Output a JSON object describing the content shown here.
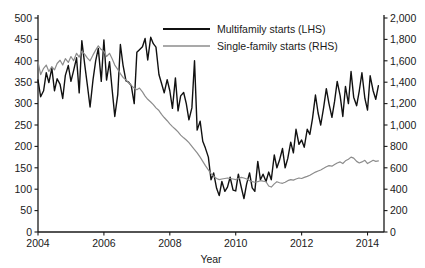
{
  "chart_data": {
    "type": "line",
    "title": "",
    "xlabel": "Year",
    "ylabel": "",
    "grid": false,
    "legend_position": "top-center",
    "xlim": [
      2004,
      2014.5
    ],
    "x_ticks": [
      2004,
      2006,
      2008,
      2010,
      2012,
      2014
    ],
    "x_tick_labels": [
      "2004",
      "2006",
      "2008",
      "2010",
      "2012",
      "2014"
    ],
    "left_axis": {
      "label": "",
      "ylim": [
        0,
        500
      ],
      "ticks": [
        0,
        50,
        100,
        150,
        200,
        250,
        300,
        350,
        400,
        450,
        500
      ],
      "tick_labels": [
        "0",
        "50",
        "100",
        "150",
        "200",
        "250",
        "300",
        "350",
        "400",
        "450",
        "500"
      ]
    },
    "right_axis": {
      "label": "",
      "ylim": [
        0,
        2000
      ],
      "ticks": [
        0,
        200,
        400,
        600,
        800,
        1000,
        1200,
        1400,
        1600,
        1800,
        2000
      ],
      "tick_labels": [
        "0",
        "200",
        "400",
        "600",
        "800",
        "1,000",
        "1,200",
        "1,400",
        "1,600",
        "1,800",
        "2,000"
      ]
    },
    "series": [
      {
        "name": "Multifamily starts (LHS)",
        "axis": "left",
        "color": "#111111",
        "width": 1.4,
        "x": [
          2004.0,
          2004.08,
          2004.17,
          2004.25,
          2004.33,
          2004.42,
          2004.5,
          2004.58,
          2004.67,
          2004.75,
          2004.83,
          2004.92,
          2005.0,
          2005.08,
          2005.17,
          2005.25,
          2005.33,
          2005.42,
          2005.5,
          2005.58,
          2005.67,
          2005.75,
          2005.83,
          2005.92,
          2006.0,
          2006.08,
          2006.17,
          2006.25,
          2006.33,
          2006.42,
          2006.5,
          2006.58,
          2006.67,
          2006.75,
          2006.83,
          2006.92,
          2007.0,
          2007.08,
          2007.17,
          2007.25,
          2007.33,
          2007.42,
          2007.5,
          2007.58,
          2007.67,
          2007.75,
          2007.83,
          2007.92,
          2008.0,
          2008.08,
          2008.17,
          2008.25,
          2008.33,
          2008.42,
          2008.5,
          2008.58,
          2008.67,
          2008.75,
          2008.83,
          2008.92,
          2009.0,
          2009.08,
          2009.17,
          2009.25,
          2009.33,
          2009.42,
          2009.5,
          2009.58,
          2009.67,
          2009.75,
          2009.83,
          2009.92,
          2010.0,
          2010.08,
          2010.17,
          2010.25,
          2010.33,
          2010.42,
          2010.5,
          2010.58,
          2010.67,
          2010.75,
          2010.83,
          2010.92,
          2011.0,
          2011.08,
          2011.17,
          2011.25,
          2011.33,
          2011.42,
          2011.5,
          2011.58,
          2011.67,
          2011.75,
          2011.83,
          2011.92,
          2012.0,
          2012.08,
          2012.17,
          2012.25,
          2012.33,
          2012.42,
          2012.5,
          2012.58,
          2012.67,
          2012.75,
          2012.83,
          2012.92,
          2013.0,
          2013.08,
          2013.17,
          2013.25,
          2013.33,
          2013.42,
          2013.5,
          2013.58,
          2013.67,
          2013.75,
          2013.83,
          2013.92,
          2014.0,
          2014.08,
          2014.17,
          2014.25,
          2014.33
        ],
        "values": [
          355,
          316,
          330,
          372,
          349,
          383,
          330,
          358,
          345,
          312,
          366,
          389,
          352,
          377,
          407,
          325,
          447,
          390,
          342,
          292,
          356,
          400,
          429,
          352,
          449,
          355,
          398,
          333,
          270,
          321,
          438,
          390,
          353,
          350,
          342,
          300,
          420,
          426,
          433,
          452,
          402,
          455,
          440,
          432,
          368,
          347,
          325,
          356,
          330,
          289,
          360,
          283,
          318,
          326,
          300,
          262,
          290,
          400,
          238,
          259,
          212,
          196,
          175,
          122,
          138,
          102,
          85,
          118,
          95,
          105,
          128,
          98,
          96,
          135,
          104,
          78,
          112,
          138,
          103,
          95,
          165,
          122,
          135,
          118,
          140,
          122,
          180,
          150,
          168,
          195,
          150,
          172,
          210,
          185,
          240,
          205,
          215,
          198,
          240,
          228,
          265,
          320,
          278,
          250,
          292,
          335,
          300,
          268,
          305,
          352,
          318,
          270,
          340,
          300,
          375,
          315,
          295,
          330,
          372,
          312,
          285,
          365,
          330,
          310,
          342
        ]
      },
      {
        "name": "Single-family starts (RHS)",
        "axis": "right",
        "color": "#8c8c8c",
        "width": 1.2,
        "x": [
          2004.0,
          2004.08,
          2004.17,
          2004.25,
          2004.33,
          2004.42,
          2004.5,
          2004.58,
          2004.67,
          2004.75,
          2004.83,
          2004.92,
          2005.0,
          2005.08,
          2005.17,
          2005.25,
          2005.33,
          2005.42,
          2005.5,
          2005.58,
          2005.67,
          2005.75,
          2005.83,
          2005.92,
          2006.0,
          2006.08,
          2006.17,
          2006.25,
          2006.33,
          2006.42,
          2006.5,
          2006.58,
          2006.67,
          2006.75,
          2006.83,
          2006.92,
          2007.0,
          2007.08,
          2007.17,
          2007.25,
          2007.33,
          2007.42,
          2007.5,
          2007.58,
          2007.67,
          2007.75,
          2007.83,
          2007.92,
          2008.0,
          2008.08,
          2008.17,
          2008.25,
          2008.33,
          2008.42,
          2008.5,
          2008.58,
          2008.67,
          2008.75,
          2008.83,
          2008.92,
          2009.0,
          2009.08,
          2009.17,
          2009.25,
          2009.33,
          2009.42,
          2009.5,
          2009.58,
          2009.67,
          2009.75,
          2009.83,
          2009.92,
          2010.0,
          2010.08,
          2010.17,
          2010.25,
          2010.33,
          2010.42,
          2010.5,
          2010.58,
          2010.67,
          2010.75,
          2010.83,
          2010.92,
          2011.0,
          2011.08,
          2011.17,
          2011.25,
          2011.33,
          2011.42,
          2011.5,
          2011.58,
          2011.67,
          2011.75,
          2011.83,
          2011.92,
          2012.0,
          2012.08,
          2012.17,
          2012.25,
          2012.33,
          2012.42,
          2012.5,
          2012.58,
          2012.67,
          2012.75,
          2012.83,
          2012.92,
          2013.0,
          2013.08,
          2013.17,
          2013.25,
          2013.33,
          2013.42,
          2013.5,
          2013.58,
          2013.67,
          2013.75,
          2013.83,
          2013.92,
          2014.0,
          2014.08,
          2014.17,
          2014.25,
          2014.33
        ],
        "values": [
          1590,
          1470,
          1530,
          1560,
          1500,
          1545,
          1515,
          1575,
          1605,
          1560,
          1620,
          1585,
          1640,
          1600,
          1670,
          1635,
          1690,
          1660,
          1625,
          1600,
          1655,
          1700,
          1740,
          1705,
          1690,
          1640,
          1670,
          1620,
          1560,
          1520,
          1480,
          1445,
          1420,
          1395,
          1370,
          1345,
          1330,
          1345,
          1310,
          1270,
          1240,
          1215,
          1190,
          1160,
          1135,
          1100,
          1070,
          1040,
          1010,
          985,
          960,
          935,
          905,
          880,
          860,
          835,
          800,
          770,
          740,
          700,
          660,
          620,
          580,
          545,
          520,
          500,
          490,
          495,
          500,
          505,
          500,
          495,
          490,
          500,
          510,
          505,
          495,
          480,
          470,
          465,
          470,
          480,
          475,
          470,
          430,
          420,
          450,
          470,
          460,
          455,
          465,
          480,
          490,
          485,
          495,
          505,
          500,
          510,
          520,
          530,
          545,
          560,
          570,
          580,
          595,
          610,
          620,
          615,
          630,
          645,
          655,
          640,
          665,
          680,
          700,
          690,
          660,
          645,
          655,
          670,
          640,
          655,
          670,
          660,
          665
        ]
      }
    ]
  },
  "legend": {
    "items": [
      {
        "label": "Multifamily starts (LHS)",
        "color": "#111111"
      },
      {
        "label": "Single-family starts (RHS)",
        "color": "#8c8c8c"
      }
    ]
  },
  "axis_titles": {
    "x": "Year"
  }
}
